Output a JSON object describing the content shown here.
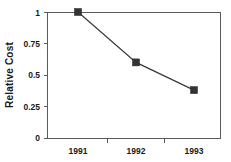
{
  "chart_data": {
    "type": "line",
    "title": "",
    "xlabel": "",
    "ylabel": "Relative Cost",
    "categories": [
      "1991",
      "1992",
      "1993"
    ],
    "values": [
      1.0,
      0.6,
      0.38
    ],
    "series": [
      {
        "name": "Relative Cost",
        "values": [
          1.0,
          0.6,
          0.38
        ],
        "marker": "square",
        "marker_color": "#333333",
        "line_color": "#3a3a3a"
      }
    ],
    "ylim": [
      0,
      1
    ],
    "yticks": [
      0,
      0.25,
      0.5,
      0.75,
      1
    ],
    "ytick_labels": [
      "0",
      "0.25",
      "0.5",
      "0.75",
      "1"
    ],
    "xtick_labels": [
      "1991",
      "1992",
      "1993"
    ],
    "grid": false,
    "legend": false,
    "legend_position": "none",
    "frame": "box",
    "background_color": "#ffffff",
    "axis_color": "#5a5a5a"
  },
  "axis": {
    "y_title": "Relative Cost",
    "y_labels": {
      "t0": "1",
      "t1": "0.75",
      "t2": "0.5",
      "t3": "0.25",
      "t4": "0"
    },
    "x_labels": {
      "t0": "1991",
      "t1": "1992",
      "t2": "1993"
    }
  }
}
